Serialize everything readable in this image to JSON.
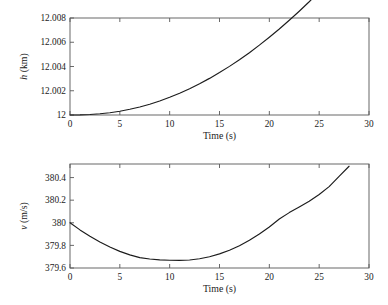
{
  "figure": {
    "background_color": "#ffffff",
    "curve_color": "#1c1c1c",
    "axis_color": "#585858"
  },
  "chart_data": [
    {
      "type": "line",
      "id": "altitude-vs-time",
      "title": "",
      "xlabel": "Time (s)",
      "ylabel": "h (km)",
      "ylabel_italic_symbol": "h",
      "ylabel_unit": " (km)",
      "xlim": [
        0,
        30
      ],
      "ylim": [
        12,
        12.008
      ],
      "xticks": [
        0,
        5,
        10,
        15,
        20,
        25,
        30
      ],
      "xticklabels": [
        "0",
        "5",
        "10",
        "15",
        "20",
        "25",
        "30"
      ],
      "yticks": [
        12,
        12.002,
        12.004,
        12.006,
        12.008
      ],
      "yticklabels": [
        "12",
        "12.002",
        "12.004",
        "12.006",
        "12.008"
      ],
      "grid": false,
      "legend": null,
      "series": [
        {
          "name": "h",
          "x": [
            0,
            1,
            2,
            3,
            4,
            5,
            6,
            7,
            8,
            9,
            10,
            11,
            12,
            13,
            14,
            15,
            16,
            17,
            18,
            19,
            20,
            21,
            22,
            23,
            24,
            25,
            26,
            27,
            28
          ],
          "values": [
            12.0,
            12.00001,
            12.00004,
            12.0001,
            12.00019,
            12.00031,
            12.00047,
            12.00066,
            12.00089,
            12.00116,
            12.00146,
            12.0018,
            12.00217,
            12.00258,
            12.00302,
            12.0035,
            12.00401,
            12.00456,
            12.00514,
            12.00576,
            12.00641,
            12.00709,
            12.00781,
            12.00856,
            12.00934,
            12.01016,
            12.01101,
            12.0119,
            12.01282
          ]
        }
      ]
    },
    {
      "type": "line",
      "id": "velocity-vs-time",
      "title": "",
      "xlabel": "Time (s)",
      "ylabel": "v (m/s)",
      "ylabel_italic_symbol": "v",
      "ylabel_unit": " (m/s)",
      "xlim": [
        0,
        30
      ],
      "ylim": [
        379.6,
        380.52
      ],
      "xticks": [
        0,
        5,
        10,
        15,
        20,
        25,
        30
      ],
      "xticklabels": [
        "0",
        "5",
        "10",
        "15",
        "20",
        "25",
        "30"
      ],
      "yticks": [
        379.6,
        379.8,
        380,
        380.2,
        380.4
      ],
      "yticklabels": [
        "379.6",
        "379.8",
        "380",
        "380.2",
        "380.4"
      ],
      "grid": false,
      "legend": null,
      "series": [
        {
          "name": "v",
          "x": [
            0,
            1,
            2,
            3,
            4,
            5,
            6,
            7,
            8,
            9,
            10,
            11,
            12,
            13,
            14,
            15,
            16,
            17,
            18,
            19,
            20,
            21,
            22,
            23,
            24,
            25,
            26,
            27,
            28
          ],
          "values": [
            380.0,
            379.937,
            379.88,
            379.83,
            379.785,
            379.747,
            379.716,
            379.692,
            379.68,
            379.672,
            379.669,
            379.668,
            379.671,
            379.682,
            379.7,
            379.725,
            379.757,
            379.797,
            379.845,
            379.9,
            379.963,
            380.033,
            380.09,
            380.14,
            380.19,
            380.25,
            380.32,
            380.41,
            380.5
          ]
        }
      ]
    }
  ]
}
